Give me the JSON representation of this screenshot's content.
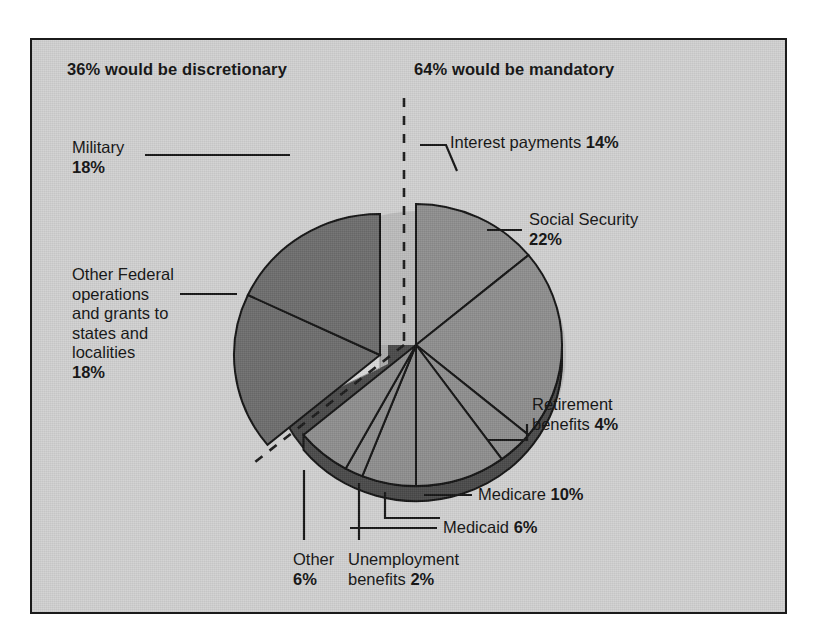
{
  "figure": {
    "background_color": "#d2d2d2",
    "border_color": "#1b1b1b"
  },
  "headers": {
    "discretionary": "36% would be discretionary",
    "mandatory": "64% would be mandatory"
  },
  "labels": {
    "military": "Military\n18%",
    "other_federal": "Other Federal\noperations\nand grants to\nstates and\nlocalities\n18%",
    "interest": "Interest payments 14%",
    "social_security": "Social Security\n22%",
    "retirement": "Retirement\nbenefits 4%",
    "medicare": "Medicare 10%",
    "medicaid": "Medicaid 6%",
    "other": "Other\n6%",
    "unemployment": "Unemployment\nbenefits 2%"
  },
  "chart_data": {
    "type": "pie",
    "title": "",
    "subtitle": "",
    "xlabel": "",
    "ylabel": "",
    "grid": false,
    "legend_position": "callout-labels",
    "style": "3d-exploded-pie",
    "units": "percent of federal budget",
    "groups": [
      {
        "name": "36% would be discretionary",
        "total": 36,
        "exploded": true,
        "slice_fill": "#6e6e6e"
      },
      {
        "name": "64% would be mandatory",
        "total": 64,
        "exploded": false,
        "slice_fill": "#8f8f8f"
      }
    ],
    "categories": [
      "Interest payments",
      "Social Security",
      "Retirement benefits",
      "Medicare",
      "Medicaid",
      "Unemployment benefits",
      "Other",
      "Other Federal operations and grants to states and localities",
      "Military"
    ],
    "values": [
      14,
      22,
      4,
      10,
      6,
      2,
      6,
      18,
      18
    ],
    "slices": [
      {
        "label": "Interest payments",
        "value": 14,
        "group": "mandatory",
        "fill": "#8f8f8f"
      },
      {
        "label": "Social Security",
        "value": 22,
        "group": "mandatory",
        "fill": "#8f8f8f"
      },
      {
        "label": "Retirement benefits",
        "value": 4,
        "group": "mandatory",
        "fill": "#8f8f8f"
      },
      {
        "label": "Medicare",
        "value": 10,
        "group": "mandatory",
        "fill": "#8f8f8f"
      },
      {
        "label": "Medicaid",
        "value": 6,
        "group": "mandatory",
        "fill": "#8f8f8f"
      },
      {
        "label": "Unemployment benefits",
        "value": 2,
        "group": "mandatory",
        "fill": "#8f8f8f"
      },
      {
        "label": "Other",
        "value": 6,
        "group": "mandatory",
        "fill": "#8f8f8f"
      },
      {
        "label": "Other Federal operations and grants to states and localities",
        "value": 18,
        "group": "discretionary",
        "fill": "#6e6e6e"
      },
      {
        "label": "Military",
        "value": 18,
        "group": "discretionary",
        "fill": "#6e6e6e"
      }
    ],
    "ylim": [
      0,
      100
    ]
  }
}
